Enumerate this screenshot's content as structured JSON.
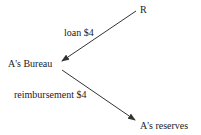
{
  "diagram": {
    "type": "flow",
    "nodes": [
      {
        "id": "R",
        "label": "R"
      },
      {
        "id": "bureau",
        "label": "A's Bureau"
      },
      {
        "id": "reserves",
        "label": "A's reserves"
      }
    ],
    "edges": [
      {
        "from": "R",
        "to": "bureau",
        "label": "loan $4"
      },
      {
        "from": "bureau",
        "to": "reserves",
        "label": "reimbursement $4"
      }
    ],
    "colors": {
      "line": "#333333",
      "text": "#222222",
      "background": "#ffffff"
    }
  }
}
